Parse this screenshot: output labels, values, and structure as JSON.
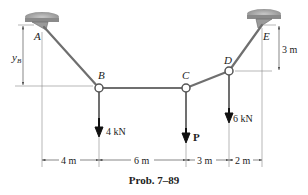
{
  "diagram": {
    "type": "cable-system",
    "points": {
      "A": {
        "label": "A",
        "x": 42,
        "y": 26
      },
      "B": {
        "label": "B",
        "x": 99,
        "y": 88
      },
      "C": {
        "label": "C",
        "x": 186,
        "y": 88
      },
      "D": {
        "label": "D",
        "x": 229,
        "y": 71
      },
      "E": {
        "label": "E",
        "x": 266,
        "y": 22
      }
    },
    "loads": {
      "B": {
        "label": "4 kN"
      },
      "C": {
        "label": "P"
      },
      "D": {
        "label": "6 kN"
      }
    },
    "dimensions": {
      "yB": {
        "label": "y",
        "sub": "B"
      },
      "E_height": "3 m",
      "horizontal": [
        "4 m",
        "6 m",
        "3 m",
        "2 m"
      ]
    },
    "colors": {
      "cable": "#6f6f6f",
      "support": "#8a8a8a",
      "arrow": "#111111",
      "dim_line": "#555555"
    }
  },
  "caption": "Prob. 7–89"
}
